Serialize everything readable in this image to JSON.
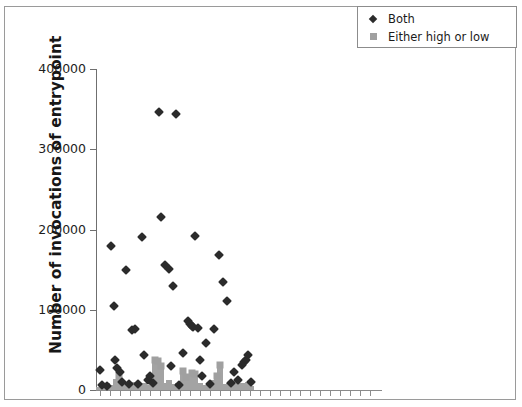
{
  "chart_data": {
    "type": "scatter",
    "title": "",
    "subtitle": "",
    "xlabel": "",
    "ylabel": "Number of invocations of entrypoint",
    "ylim": [
      0,
      400000
    ],
    "ytick_labels": [
      "0",
      "100000",
      "200000",
      "300000",
      "400000"
    ],
    "ytick_values": [
      0,
      100000,
      200000,
      300000,
      400000
    ],
    "xlim": [
      0,
      100
    ],
    "xtick_labels": [],
    "grid": false,
    "legend_position": "top-right",
    "colors": {
      "both": "#2b2b2b",
      "either": "#a0a0a0",
      "axis": "#6f6f6f",
      "frame": "#9a9a9a",
      "background": "#ffffff"
    },
    "series": [
      {
        "name": "Both",
        "marker": "diamond",
        "color": "#2b2b2b",
        "points": [
          [
            1.4,
            25000
          ],
          [
            2.2,
            6000
          ],
          [
            4.0,
            5000
          ],
          [
            5.2,
            180000
          ],
          [
            6.4,
            105000
          ],
          [
            6.8,
            37000
          ],
          [
            7.6,
            27000
          ],
          [
            8.4,
            23000
          ],
          [
            9.2,
            10000
          ],
          [
            10.5,
            150000
          ],
          [
            11.6,
            8000
          ],
          [
            12.8,
            75000
          ],
          [
            14.0,
            76000
          ],
          [
            15.0,
            8000
          ],
          [
            16.2,
            191000
          ],
          [
            17.0,
            43000
          ],
          [
            18.4,
            13000
          ],
          [
            19.0,
            17000
          ],
          [
            20.1,
            9000
          ],
          [
            22.4,
            346000
          ],
          [
            23.2,
            215000
          ],
          [
            24.6,
            156000
          ],
          [
            25.8,
            151000
          ],
          [
            26.6,
            30000
          ],
          [
            27.4,
            129000
          ],
          [
            28.2,
            344000
          ],
          [
            29.4,
            6000
          ],
          [
            31.0,
            46000
          ],
          [
            32.6,
            86000
          ],
          [
            33.4,
            82000
          ],
          [
            33.9,
            80000
          ],
          [
            34.4,
            78000
          ],
          [
            35.1,
            192000
          ],
          [
            36.0,
            77000
          ],
          [
            36.8,
            38000
          ],
          [
            37.6,
            18000
          ],
          [
            39.0,
            58000
          ],
          [
            40.4,
            7000
          ],
          [
            42.0,
            76000
          ],
          [
            43.6,
            168000
          ],
          [
            45.0,
            135000
          ],
          [
            46.4,
            111000
          ],
          [
            47.8,
            9000
          ],
          [
            49.0,
            22000
          ],
          [
            50.2,
            12000
          ],
          [
            51.6,
            31000
          ],
          [
            52.4,
            35000
          ],
          [
            53.2,
            37000
          ],
          [
            54.0,
            44000
          ],
          [
            54.8,
            10000
          ]
        ]
      },
      {
        "name": "Either high or low",
        "marker": "square",
        "color": "#a0a0a0",
        "points": [
          [
            1.0,
            4000
          ],
          [
            2.0,
            7000
          ],
          [
            3.0,
            5000
          ],
          [
            4.0,
            9000
          ],
          [
            5.0,
            6000
          ],
          [
            6.0,
            5000
          ],
          [
            7.0,
            14000
          ],
          [
            8.0,
            17000
          ],
          [
            9.0,
            6000
          ],
          [
            10.0,
            8000
          ],
          [
            11.0,
            5000
          ],
          [
            12.0,
            4000
          ],
          [
            13.0,
            10000
          ],
          [
            14.0,
            6000
          ],
          [
            15.0,
            5000
          ],
          [
            16.0,
            7000
          ],
          [
            17.0,
            9000
          ],
          [
            18.0,
            5000
          ],
          [
            19.0,
            6000
          ],
          [
            20.0,
            11000
          ],
          [
            21.0,
            38000
          ],
          [
            22.0,
            36000
          ],
          [
            23.0,
            30000
          ],
          [
            24.0,
            9000
          ],
          [
            25.0,
            6000
          ],
          [
            26.0,
            12000
          ],
          [
            27.0,
            7000
          ],
          [
            28.0,
            5000
          ],
          [
            29.0,
            9000
          ],
          [
            30.0,
            8000
          ],
          [
            31.0,
            24000
          ],
          [
            32.0,
            16000
          ],
          [
            33.0,
            6000
          ],
          [
            34.0,
            21000
          ],
          [
            35.0,
            20000
          ],
          [
            36.0,
            7000
          ],
          [
            37.0,
            9000
          ],
          [
            38.0,
            6000
          ],
          [
            39.0,
            5000
          ],
          [
            40.0,
            8000
          ],
          [
            41.0,
            12000
          ],
          [
            42.0,
            10000
          ],
          [
            43.0,
            18000
          ],
          [
            44.0,
            31000
          ],
          [
            45.0,
            7000
          ],
          [
            46.0,
            6000
          ],
          [
            47.0,
            9000
          ],
          [
            48.0,
            5000
          ],
          [
            49.0,
            8000
          ],
          [
            50.0,
            13000
          ],
          [
            51.0,
            6000
          ],
          [
            52.0,
            9000
          ],
          [
            53.0,
            7000
          ],
          [
            54.0,
            10000
          ],
          [
            55.0,
            5000
          ]
        ]
      }
    ]
  },
  "legend": {
    "entries": [
      {
        "label": "Both",
        "marker": "diamond-icon"
      },
      {
        "label": "Either high or low",
        "marker": "square-icon"
      }
    ]
  },
  "axes": {
    "y_title": "Number of invocations of entrypoint",
    "y_ticks": [
      "400000",
      "300000",
      "200000",
      "100000",
      "0"
    ]
  }
}
